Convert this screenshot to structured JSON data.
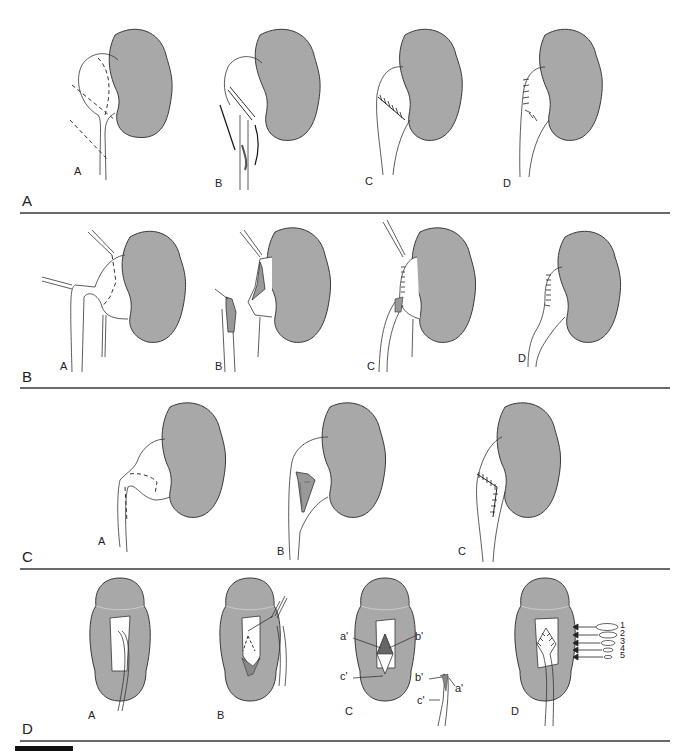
{
  "colors": {
    "kidney_fill": "#a8a8a8",
    "kidney_stroke": "#3a3a3a",
    "rule": "#6a6a6a",
    "line": "#333333"
  },
  "panels": [
    {
      "label": "A",
      "subfigures": [
        {
          "label": "A",
          "description": "dilated renal pelvis with dashed excision lines"
        },
        {
          "label": "B",
          "description": "pelvis resected with stay sutures"
        },
        {
          "label": "C",
          "description": "anastomosis sutured"
        },
        {
          "label": "D",
          "description": "completed repair with sutures"
        }
      ]
    },
    {
      "label": "B",
      "subfigures": [
        {
          "label": "A",
          "description": "pelvis with dashed incision and stay sutures"
        },
        {
          "label": "B",
          "description": "flap created and ureter spatulated"
        },
        {
          "label": "C",
          "description": "flap anastomosis in progress"
        },
        {
          "label": "D",
          "description": "completed flap repair"
        }
      ]
    },
    {
      "label": "C",
      "subfigures": [
        {
          "label": "A",
          "description": "spiral flap outlined with dashed lines"
        },
        {
          "label": "B",
          "description": "flap rotated down ureter"
        },
        {
          "label": "C",
          "description": "spiral flap sutured"
        }
      ]
    },
    {
      "label": "D",
      "subfigures": [
        {
          "label": "A",
          "description": "intrarenal exposure with ureter"
        },
        {
          "label": "B",
          "description": "incision with forceps"
        },
        {
          "label": "C",
          "description": "flap points marked",
          "annotations": [
            "a'",
            "b'",
            "c'",
            "b'",
            "a'",
            "c'"
          ]
        },
        {
          "label": "D",
          "description": "sutured with graded closure",
          "legend": [
            "1",
            "2",
            "3",
            "4",
            "5"
          ]
        }
      ]
    }
  ]
}
